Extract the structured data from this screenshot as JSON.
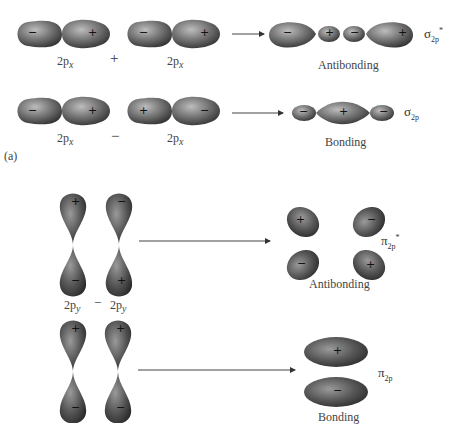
{
  "figure": {
    "panel_label": "(a)",
    "sigma": {
      "antibonding": {
        "left_orbital_label": "2p",
        "left_orbital_sub": "x",
        "operator": "+",
        "right_orbital_label": "2p",
        "right_orbital_sub": "x",
        "result_label": "Antibonding",
        "symbol": "σ",
        "symbol_sub": "2p",
        "symbol_sup": "*",
        "left_signs": [
          "−",
          "+"
        ],
        "right_signs": [
          "−",
          "+"
        ],
        "result_signs": [
          "−",
          "+",
          "−",
          "+"
        ]
      },
      "bonding": {
        "left_orbital_label": "2p",
        "left_orbital_sub": "x",
        "operator": "−",
        "right_orbital_label": "2p",
        "right_orbital_sub": "x",
        "result_label": "Bonding",
        "symbol": "σ",
        "symbol_sub": "2p",
        "left_signs": [
          "−",
          "+"
        ],
        "right_signs": [
          "+",
          "−"
        ],
        "result_signs": [
          "−",
          "+",
          "−"
        ]
      }
    },
    "pi": {
      "antibonding": {
        "left_orbital_label": "2p",
        "left_orbital_sub": "y",
        "operator": "−",
        "right_orbital_label": "2p",
        "right_orbital_sub": "y",
        "result_label": "Antibonding",
        "symbol": "π",
        "symbol_sub": "2p",
        "symbol_sup": "*",
        "left_signs": [
          "+",
          "−"
        ],
        "right_signs": [
          "−",
          "+"
        ],
        "result_signs": [
          "+",
          "−",
          "−",
          "+"
        ]
      },
      "bonding": {
        "result_label": "Bonding",
        "symbol": "π",
        "symbol_sub": "2p",
        "left_signs": [
          "+",
          "−"
        ],
        "right_signs": [
          "+",
          "−"
        ],
        "result_signs": [
          "+",
          "−"
        ]
      }
    }
  }
}
